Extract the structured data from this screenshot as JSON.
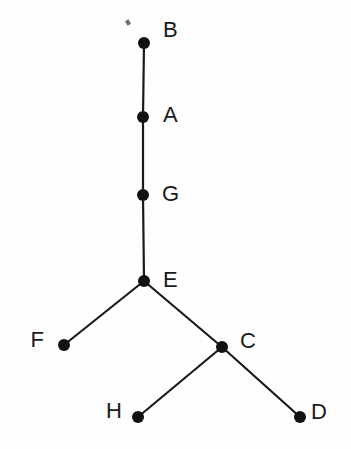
{
  "figure": {
    "width": 351,
    "height": 449,
    "background_color": "#fefefe",
    "node_color": "#111111",
    "edge_color": "#1a1a1a",
    "label_color": "#1a1a1a"
  },
  "chart_data": {
    "type": "diagram",
    "subtype": "node-link-tree",
    "title": "",
    "xlabel": "",
    "ylabel": "",
    "grid": false,
    "legend": false,
    "xlim": [
      0,
      351
    ],
    "ylim": [
      0,
      449
    ],
    "node_radius": 6,
    "edge_width": 2.2,
    "nodes": [
      {
        "id": "B",
        "label": "B",
        "x": 144,
        "y": 43,
        "label_x": 163,
        "label_y": 31,
        "label_anchor": "start"
      },
      {
        "id": "A",
        "label": "A",
        "x": 143,
        "y": 117,
        "label_x": 163,
        "label_y": 116,
        "label_anchor": "start"
      },
      {
        "id": "G",
        "label": "G",
        "x": 143,
        "y": 195,
        "label_x": 162,
        "label_y": 195,
        "label_anchor": "start"
      },
      {
        "id": "E",
        "label": "E",
        "x": 144,
        "y": 281,
        "label_x": 163,
        "label_y": 281,
        "label_anchor": "start"
      },
      {
        "id": "F",
        "label": "F",
        "x": 64,
        "y": 345,
        "label_x": 44,
        "label_y": 341,
        "label_anchor": "end"
      },
      {
        "id": "C",
        "label": "C",
        "x": 222,
        "y": 347,
        "label_x": 240,
        "label_y": 342,
        "label_anchor": "start"
      },
      {
        "id": "H",
        "label": "H",
        "x": 138,
        "y": 417,
        "label_x": 122,
        "label_y": 412,
        "label_anchor": "end"
      },
      {
        "id": "D",
        "label": "D",
        "x": 300,
        "y": 417,
        "label_x": 311,
        "label_y": 413,
        "label_anchor": "start"
      }
    ],
    "edges": [
      {
        "id": "B-A",
        "source": "B",
        "target": "A",
        "x1": 144,
        "y1": 43,
        "x2": 143,
        "y2": 117
      },
      {
        "id": "A-G",
        "source": "A",
        "target": "G",
        "x1": 143,
        "y1": 117,
        "x2": 143,
        "y2": 195
      },
      {
        "id": "G-E",
        "source": "G",
        "target": "E",
        "x1": 143,
        "y1": 195,
        "x2": 144,
        "y2": 281
      },
      {
        "id": "E-F",
        "source": "E",
        "target": "F",
        "x1": 144,
        "y1": 281,
        "x2": 64,
        "y2": 345
      },
      {
        "id": "E-C",
        "source": "E",
        "target": "C",
        "x1": 144,
        "y1": 281,
        "x2": 222,
        "y2": 347
      },
      {
        "id": "C-H",
        "source": "C",
        "target": "H",
        "x1": 222,
        "y1": 347,
        "x2": 138,
        "y2": 417
      },
      {
        "id": "C-D",
        "source": "C",
        "target": "D",
        "x1": 222,
        "y1": 347,
        "x2": 300,
        "y2": 417
      }
    ],
    "artifacts": [
      {
        "id": "speck",
        "x": 126,
        "y": 20,
        "width": 4,
        "height": 5
      }
    ]
  }
}
